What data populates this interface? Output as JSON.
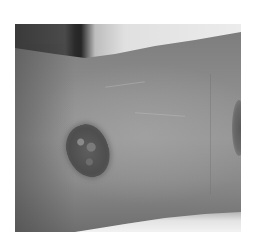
{
  "image": {
    "description": "Grayscale clinical photograph of a forearm showing a raised, rough-surfaced oval skin lesion, with a second lesion partially visible at the right edge",
    "colors": {
      "border": "#ffffff",
      "skin": "#8e8e8e",
      "lesion": "#555555",
      "background_light": "#e6e6e6",
      "background_dark": "#2a2a2a"
    }
  }
}
